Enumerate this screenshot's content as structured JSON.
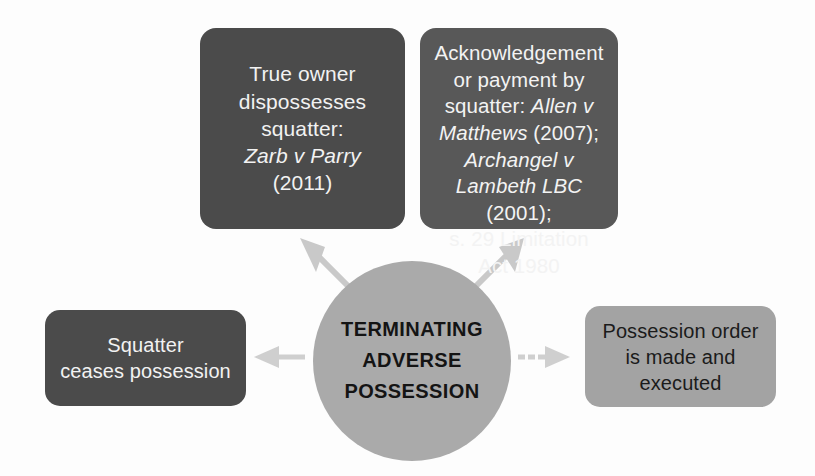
{
  "diagram": {
    "title": "Terminating Adverse Possession",
    "center": {
      "label": "TERMINATING\nADVERSE\nPOSSESSION",
      "shape": "ellipse",
      "fill": "#aaaaaa",
      "text_color": "#141414"
    },
    "nodes": [
      {
        "id": "true-owner",
        "label": "True owner\ndispossesses\nsquatter:\nZarb v Parry\n(2011)",
        "plain_lines": [
          "True owner",
          "dispossesses",
          "squatter:",
          "(2011)"
        ],
        "italic_lines": [
          "Zarb v Parry"
        ],
        "position": "top-left",
        "fill": "#4b4b4b",
        "text_color": "#f2f2f2"
      },
      {
        "id": "acknowledgement",
        "label": "Acknowledgement\nor payment by\nsquatter: Allen v\nMatthews (2007);\nArchangel v\nLambeth LBC (2001);\ns. 29 Limitation\nAct 1980",
        "position": "top-right",
        "fill": "#585858",
        "text_color": "#f3f3f3",
        "lines": [
          {
            "text": "Acknowledgement",
            "style": "normal"
          },
          {
            "text": "or payment by",
            "style": "normal"
          },
          {
            "text": "squatter: ",
            "style": "normal",
            "italic_tail": "Allen v"
          },
          {
            "text": "Matthews",
            "style": "italic",
            "normal_tail": " (2007);"
          },
          {
            "text": "Archangel v",
            "style": "italic"
          },
          {
            "text": "Lambeth LBC",
            "style": "italic",
            "normal_tail": " (2001);"
          },
          {
            "text": "s. 29 Limitation",
            "style": "normal"
          },
          {
            "text": "Act 1980",
            "style": "normal"
          }
        ]
      },
      {
        "id": "squatter-ceases",
        "label": "Squatter\nceases possession",
        "position": "bottom-left",
        "fill": "#4b4b4b",
        "text_color": "#f2f2f2"
      },
      {
        "id": "possession-order",
        "label": "Possession order\nis made and\nexecuted",
        "position": "bottom-right",
        "fill": "#a3a3a3",
        "text_color": "#1b1b1b"
      }
    ],
    "arrows": [
      {
        "id": "center-to-true-owner",
        "from": "center",
        "to": "true-owner",
        "direction": "up-left",
        "color": "#c9c9c9"
      },
      {
        "id": "center-to-acknowledgement",
        "from": "center",
        "to": "acknowledgement",
        "direction": "up-right",
        "color": "#c9c9c9"
      },
      {
        "id": "center-to-squatter-ceases",
        "from": "center",
        "to": "squatter-ceases",
        "direction": "left",
        "color": "#cfcfcf"
      },
      {
        "id": "center-to-possession-order",
        "from": "center",
        "to": "possession-order",
        "direction": "right",
        "color": "#cfcfcf"
      }
    ],
    "colors": {
      "background": "#fdfdfd",
      "dark_box": "#4b4b4b",
      "mid_box": "#585858",
      "light_box": "#a3a3a3",
      "circle": "#aaaaaa",
      "arrow": "#c9c9c9"
    }
  }
}
